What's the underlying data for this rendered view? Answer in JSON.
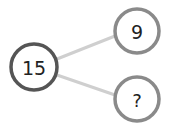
{
  "diagram": {
    "type": "number-bond",
    "whole": {
      "label": "15",
      "cx": 34,
      "cy": 67,
      "r": 23,
      "stroke": "#555555"
    },
    "parts": [
      {
        "label": "9",
        "cx": 137,
        "cy": 31,
        "r": 22,
        "stroke": "#8a8a8a"
      },
      {
        "label": "?",
        "cx": 137,
        "cy": 99,
        "r": 22,
        "stroke": "#8a8a8a"
      }
    ],
    "connector_color": "#cfcfcf"
  }
}
